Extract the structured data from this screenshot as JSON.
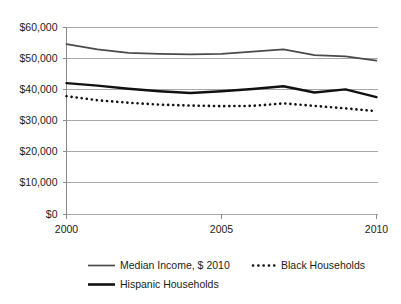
{
  "chart_data": {
    "type": "line",
    "title": "",
    "subtitle": "",
    "xlabel": "",
    "ylabel": "",
    "xlim": [
      2000,
      2010
    ],
    "ylim": [
      0,
      60000
    ],
    "grid": true,
    "legend_position": "bottom",
    "x": [
      2000,
      2001,
      2002,
      2003,
      2004,
      2005,
      2006,
      2007,
      2008,
      2009,
      2010
    ],
    "xticks": [
      "2000",
      "2005",
      "2010"
    ],
    "xtick_values": [
      2000,
      2005,
      2010
    ],
    "yticks": [
      "$0",
      "$10,000",
      "$20,000",
      "$30,000",
      "$40,000",
      "$50,000",
      "$60,000"
    ],
    "ytick_values": [
      0,
      10000,
      20000,
      30000,
      40000,
      50000,
      60000
    ],
    "series": [
      {
        "name": "Median Income, $ 2010",
        "style": "solid-thin",
        "color": "#4a4a4a",
        "values": [
          54500,
          52800,
          51700,
          51400,
          51200,
          51400,
          52100,
          52800,
          51000,
          50600,
          49200
        ]
      },
      {
        "name": "Black Households",
        "style": "dotted",
        "color": "#111111",
        "values": [
          37800,
          36500,
          35700,
          35100,
          34800,
          34600,
          34700,
          35500,
          34700,
          33900,
          33000
        ]
      },
      {
        "name": "Hispanic Households",
        "style": "solid-thick",
        "color": "#111111",
        "values": [
          42000,
          41200,
          40200,
          39400,
          38800,
          39400,
          40100,
          41000,
          39000,
          40000,
          37500
        ]
      }
    ],
    "legend": [
      {
        "label": "Median Income, $ 2010",
        "marker": "solid-thin"
      },
      {
        "label": "Black Households",
        "marker": "dotted"
      },
      {
        "label": "Hispanic Households",
        "marker": "solid-thick"
      }
    ]
  }
}
